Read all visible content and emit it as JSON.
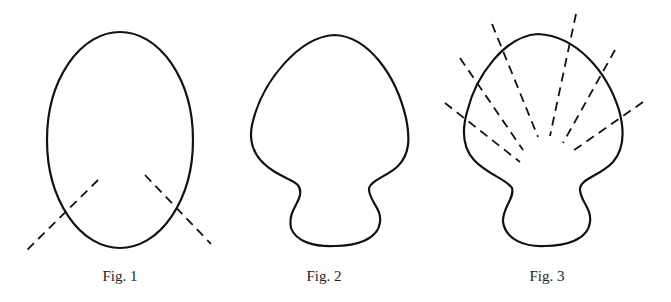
{
  "figures": [
    {
      "id": "fig1",
      "caption": "Fig. 1",
      "shape": "ellipse",
      "dashed_lines": 2
    },
    {
      "id": "fig2",
      "caption": "Fig. 2",
      "shape": "bulb-with-neck",
      "dashed_lines": 0
    },
    {
      "id": "fig3",
      "caption": "Fig. 3",
      "shape": "bulb-with-neck",
      "dashed_lines": 6
    }
  ],
  "colors": {
    "stroke": "#111111",
    "background": "#ffffff",
    "caption": "#222222"
  }
}
